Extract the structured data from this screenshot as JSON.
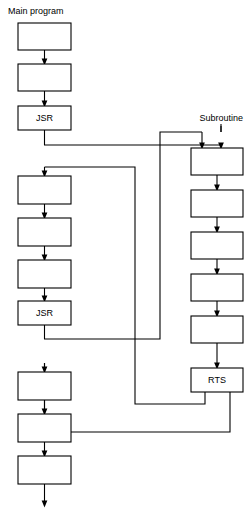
{
  "diagram": {
    "title_left": "Main program",
    "title_right": "Subroutine",
    "stroke_color": "#000000",
    "fill_color": "#ffffff",
    "background": "#ffffff",
    "width": 250,
    "height": 511,
    "main_program": {
      "label": "Main program",
      "label_x": 8,
      "label_y": 14,
      "column_x": 18,
      "box_width": 53,
      "boxes": [
        {
          "name": "main-box-1",
          "text": "",
          "x": 18,
          "y": 23,
          "w": 53,
          "h": 27
        },
        {
          "name": "main-box-2",
          "text": "",
          "x": 18,
          "y": 64,
          "w": 53,
          "h": 27
        },
        {
          "name": "main-box-jsr-1",
          "text": "JSR",
          "x": 18,
          "y": 106,
          "w": 53,
          "h": 24
        },
        {
          "name": "main-box-3",
          "text": "",
          "x": 18,
          "y": 176,
          "w": 53,
          "h": 28
        },
        {
          "name": "main-box-4",
          "text": "",
          "x": 18,
          "y": 218,
          "w": 53,
          "h": 28
        },
        {
          "name": "main-box-5",
          "text": "",
          "x": 18,
          "y": 260,
          "w": 53,
          "h": 28
        },
        {
          "name": "main-box-jsr-2",
          "text": "JSR",
          "x": 18,
          "y": 301,
          "w": 53,
          "h": 24
        },
        {
          "name": "main-box-6",
          "text": "",
          "x": 18,
          "y": 372,
          "w": 53,
          "h": 28
        },
        {
          "name": "main-box-7",
          "text": "",
          "x": 18,
          "y": 414,
          "w": 53,
          "h": 28
        },
        {
          "name": "main-box-8",
          "text": "",
          "x": 18,
          "y": 456,
          "w": 53,
          "h": 28
        }
      ]
    },
    "subroutine": {
      "label": "Subroutine",
      "label_x": 243,
      "label_y": 121,
      "column_x": 191,
      "box_width": 52,
      "boxes": [
        {
          "name": "sub-box-1",
          "text": "",
          "x": 191,
          "y": 148,
          "w": 52,
          "h": 27
        },
        {
          "name": "sub-box-2",
          "text": "",
          "x": 191,
          "y": 190,
          "w": 52,
          "h": 27
        },
        {
          "name": "sub-box-3",
          "text": "",
          "x": 191,
          "y": 232,
          "w": 52,
          "h": 27
        },
        {
          "name": "sub-box-4",
          "text": "",
          "x": 191,
          "y": 274,
          "w": 52,
          "h": 27
        },
        {
          "name": "sub-box-5",
          "text": "",
          "x": 191,
          "y": 316,
          "w": 52,
          "h": 27
        },
        {
          "name": "sub-box-rts",
          "text": "RTS",
          "x": 191,
          "y": 368,
          "w": 52,
          "h": 24
        }
      ]
    },
    "connectors": [
      {
        "name": "arrow-main1-to-main2",
        "type": "arrow",
        "d": "M 44.5 50 L 44.5 62"
      },
      {
        "name": "arrow-main2-to-jsr1",
        "type": "arrow",
        "d": "M 44.5 91 L 44.5 104"
      },
      {
        "name": "call-jsr1-to-sub",
        "type": "plain",
        "d": "M 44.5 130 L 44.5 145 L 221 145"
      },
      {
        "name": "arrow-call1-into-sub1",
        "type": "arrow",
        "d": "M 221 145 L 221 146"
      },
      {
        "name": "call-jsr2-to-sub",
        "type": "plain",
        "d": "M 44.5 325 L 44.5 339 L 160 339 L 160 132 L 202 132"
      },
      {
        "name": "arrow-call2-into-sub1",
        "type": "arrow",
        "d": "M 202 132 L 202 146"
      },
      {
        "name": "sub-entry-right-drop",
        "type": "plain",
        "d": "M 221 126 L 221 132"
      },
      {
        "name": "subroutine-label-stem",
        "type": "plain",
        "d": "M 221 124 L 221 132"
      },
      {
        "name": "arrow-sub1-to-sub2",
        "type": "arrow",
        "d": "M 217 175 L 217 188"
      },
      {
        "name": "arrow-sub2-to-sub3",
        "type": "arrow",
        "d": "M 217 217 L 217 230"
      },
      {
        "name": "arrow-sub3-to-sub4",
        "type": "arrow",
        "d": "M 217 259 L 217 272"
      },
      {
        "name": "arrow-sub4-to-sub5",
        "type": "arrow",
        "d": "M 217 301 L 217 314"
      },
      {
        "name": "arrow-sub5-to-rts",
        "type": "arrow",
        "d": "M 217 343 L 217 366"
      },
      {
        "name": "return-rts-to-main-first",
        "type": "plain",
        "d": "M 205 392 L 205 404 L 135 404 L 135 167 L 44.5 167"
      },
      {
        "name": "arrow-return1-into-main3",
        "type": "arrow",
        "d": "M 44.5 167 L 44.5 174"
      },
      {
        "name": "return-rts-to-main-second",
        "type": "plain",
        "d": "M 230 392 L 230 432 L 44.5 432 L 44.5 363"
      },
      {
        "name": "arrow-return2-into-main6",
        "type": "arrow",
        "d": "M 44.5 363 L 44.5 370"
      },
      {
        "name": "arrow-main3-to-main4",
        "type": "arrow",
        "d": "M 44.5 204 L 44.5 216"
      },
      {
        "name": "arrow-main4-to-main5",
        "type": "arrow",
        "d": "M 44.5 246 L 44.5 258"
      },
      {
        "name": "arrow-main5-to-jsr2",
        "type": "arrow",
        "d": "M 44.5 288 L 44.5 299"
      },
      {
        "name": "arrow-main6-to-main7",
        "type": "arrow",
        "d": "M 44.5 400 L 44.5 412"
      },
      {
        "name": "arrow-main7-to-main8",
        "type": "arrow",
        "d": "M 44.5 442 L 44.5 454"
      },
      {
        "name": "arrow-main8-exit",
        "type": "arrow",
        "d": "M 44.5 484 L 44.5 504"
      }
    ]
  }
}
